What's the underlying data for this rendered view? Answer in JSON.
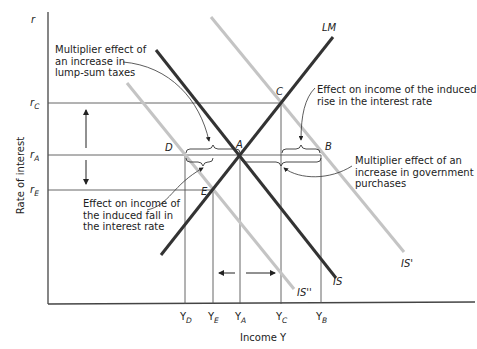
{
  "diagram": {
    "type": "IS-LM diagram",
    "y_axis": {
      "title": "Rate of interest",
      "symbol": "r"
    },
    "x_axis": {
      "title": "Income Y"
    },
    "interest_rates": [
      {
        "id": "rC",
        "base": "r",
        "sub": "C"
      },
      {
        "id": "rA",
        "base": "r",
        "sub": "A"
      },
      {
        "id": "rE",
        "base": "r",
        "sub": "E"
      }
    ],
    "income_levels": [
      {
        "id": "YD",
        "base": "Y",
        "sub": "D"
      },
      {
        "id": "YE",
        "base": "Y",
        "sub": "E"
      },
      {
        "id": "YA",
        "base": "Y",
        "sub": "A"
      },
      {
        "id": "YC",
        "base": "Y",
        "sub": "C"
      },
      {
        "id": "YB",
        "base": "Y",
        "sub": "B"
      }
    ],
    "curves": {
      "LM": "LM",
      "IS": "IS",
      "IS_prime": "IS'",
      "IS_double_prime": "IS''"
    },
    "points": {
      "A": "A",
      "B": "B",
      "C": "C",
      "D": "D",
      "E": "E"
    },
    "annotations": {
      "lump_sum": [
        "Multiplier effect of",
        "an increase in",
        "lump-sum taxes"
      ],
      "rise": [
        "Effect on income of the induced",
        "rise in the interest rate"
      ],
      "gov": [
        "Multiplier effect of an",
        "increase in government",
        "purchases"
      ],
      "fall": [
        "Effect on income of",
        "the induced fall in",
        "the interest rate"
      ]
    },
    "colors": {
      "main_curve": "#333333",
      "shifted_curve": "#c4c4c4",
      "guide": "#444444"
    }
  }
}
